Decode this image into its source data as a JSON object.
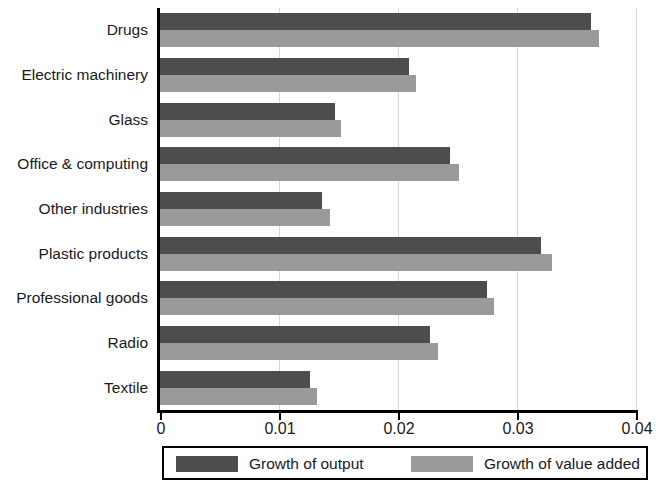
{
  "chart_data": {
    "type": "bar",
    "orientation": "horizontal",
    "title": "",
    "xlabel": "",
    "ylabel": "",
    "xlim": [
      0,
      0.04
    ],
    "xticks": [
      "0",
      "0.01",
      "0.02",
      "0.03",
      "0.04"
    ],
    "xtick_values": [
      0,
      0.01,
      0.02,
      0.03,
      0.04
    ],
    "grid": true,
    "grid_axis": "x",
    "legend_position": "bottom",
    "categories": [
      "Drugs",
      "Electric machinery",
      "Glass",
      "Office & computing",
      "Other industries",
      "Plastic products",
      "Professional goods",
      "Radio",
      "Textile"
    ],
    "series": [
      {
        "name": "Growth of output",
        "color": "#4d4d4d",
        "values": [
          0.0362,
          0.0209,
          0.0147,
          0.0244,
          0.0136,
          0.032,
          0.0275,
          0.0227,
          0.0126
        ]
      },
      {
        "name": "Growth of value added",
        "color": "#9a9a9a",
        "values": [
          0.0369,
          0.0215,
          0.0152,
          0.0251,
          0.0143,
          0.0329,
          0.0281,
          0.0234,
          0.0132
        ]
      }
    ]
  },
  "legend": {
    "items": [
      {
        "label": "Growth of output",
        "color": "#4d4d4d"
      },
      {
        "label": "Growth of value added",
        "color": "#9a9a9a"
      }
    ]
  }
}
